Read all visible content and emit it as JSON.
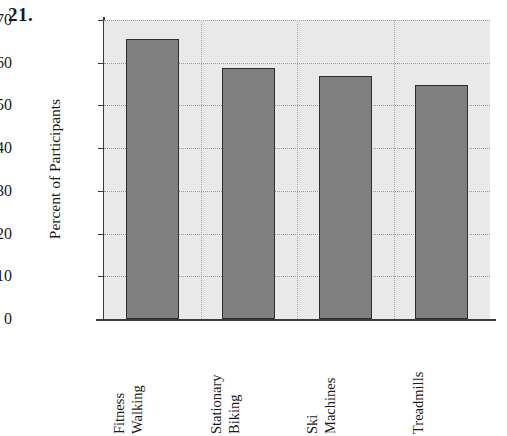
{
  "problem": {
    "number": "21."
  },
  "chart_data": {
    "type": "bar",
    "title": "",
    "xlabel": "",
    "ylabel": "Percent of Participants",
    "categories": [
      "Fitness Walking",
      "Stationary Biking",
      "Ski Machines",
      "Treadmills"
    ],
    "category_lines": [
      [
        "Fitness",
        "Walking"
      ],
      [
        "Stationary",
        "Biking"
      ],
      [
        "Ski",
        "Machines"
      ],
      [
        "Treadmills"
      ]
    ],
    "values": [
      65.5,
      58.7,
      57.0,
      54.8
    ],
    "ylim": [
      0,
      70
    ],
    "ytick_labels": [
      "0",
      "10",
      "20",
      "30",
      "40",
      "50",
      "60",
      "70"
    ],
    "ytick_values": [
      0,
      10,
      20,
      30,
      40,
      50,
      60,
      70
    ],
    "grid": true,
    "legend": "none",
    "colors": {
      "bar_fill": "#808080",
      "bar_edge": "#2e2e2e",
      "plot_background": "#e9e9e9",
      "gridline": "#9a9a9a",
      "axis": "#3a3a3a",
      "text": "#1a1a1a"
    }
  }
}
